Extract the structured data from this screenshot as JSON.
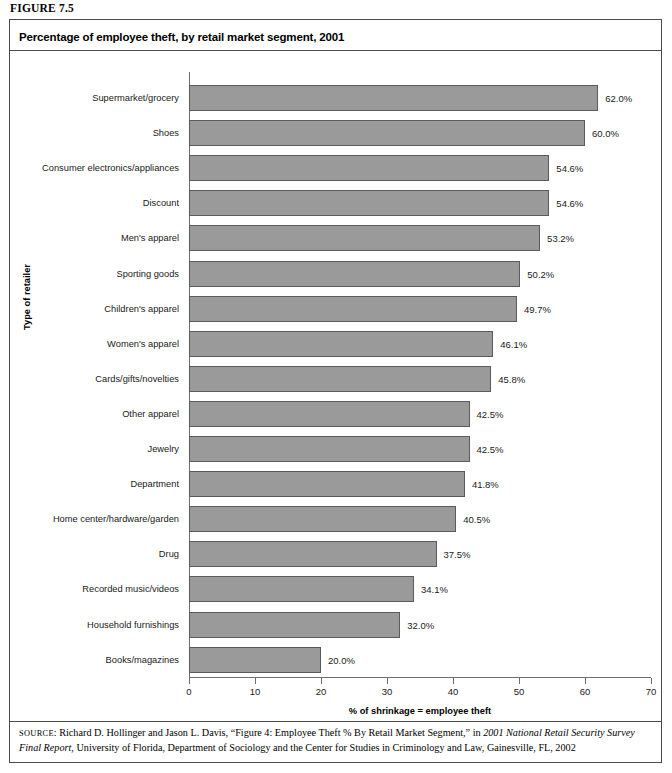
{
  "figure_label": "FIGURE 7.5",
  "chart_title": "Percentage of employee theft, by retail market segment, 2001",
  "axes": {
    "y_title": "Type of retailer",
    "x_title": "% of shrinkage = employee theft"
  },
  "source": {
    "prefix": "SOURCE",
    "text_part1": ": Richard D. Hollinger and Jason L. Davis, “Figure 4: Employee Theft % By Retail Market Segment,” in ",
    "italic1": "2001 National Retail Security Survey Final Report",
    "text_part2": ", University of Florida, Department of Sociology and the Center for Studies in Criminology and Law, Gainesville, FL, 2002"
  },
  "colors": {
    "bar_fill": "#9a9a9a",
    "bar_border": "#5b5b5b",
    "axis": "#6d6d6d",
    "frame": "#4a4a4a"
  },
  "chart_data": {
    "type": "bar",
    "orientation": "horizontal",
    "title": "Percentage of employee theft, by retail market segment, 2001",
    "xlabel": "% of shrinkage = employee theft",
    "ylabel": "Type of retailer",
    "xlim": [
      0,
      70
    ],
    "xticks": [
      0,
      10,
      20,
      30,
      40,
      50,
      60,
      70
    ],
    "grid": false,
    "legend": false,
    "categories": [
      "Supermarket/grocery",
      "Shoes",
      "Consumer electronics/appliances",
      "Discount",
      "Men's apparel",
      "Sporting goods",
      "Children's apparel",
      "Women's apparel",
      "Cards/gifts/novelties",
      "Other apparel",
      "Jewelry",
      "Department",
      "Home center/hardware/garden",
      "Drug",
      "Recorded music/videos",
      "Household furnishings",
      "Books/magazines"
    ],
    "values": [
      62.0,
      60.0,
      54.6,
      54.6,
      53.2,
      50.2,
      49.7,
      46.1,
      45.8,
      42.5,
      42.5,
      41.8,
      40.5,
      37.5,
      34.1,
      32.0,
      20.0
    ],
    "value_labels": [
      "62.0%",
      "60.0%",
      "54.6%",
      "54.6%",
      "53.2%",
      "50.2%",
      "49.7%",
      "46.1%",
      "45.8%",
      "42.5%",
      "42.5%",
      "41.8%",
      "40.5%",
      "37.5%",
      "34.1%",
      "32.0%",
      "20.0%"
    ]
  }
}
